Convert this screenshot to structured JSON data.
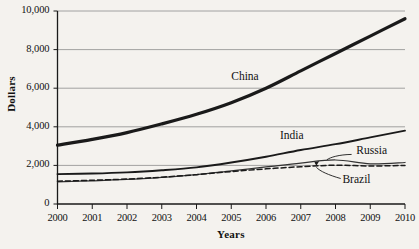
{
  "chart_data": {
    "type": "line",
    "title": "",
    "xlabel": "Years",
    "ylabel": "Dollars",
    "x": [
      2000,
      2001,
      2002,
      2003,
      2004,
      2005,
      2006,
      2007,
      2008,
      2009,
      2010
    ],
    "x_ticks": [
      "2000",
      "2001",
      "2002",
      "2003",
      "2004",
      "2005",
      "2006",
      "2007",
      "2008",
      "2009",
      "2010"
    ],
    "y_ticks": [
      "0",
      "2,000",
      "4,000",
      "6,000",
      "8,000",
      "10,000"
    ],
    "y_tick_values": [
      0,
      2000,
      4000,
      6000,
      8000,
      10000
    ],
    "ylim": [
      0,
      10000
    ],
    "xlim": [
      2000,
      2010
    ],
    "grid": "horizontal",
    "legend_position": "inline-labels",
    "series": [
      {
        "name": "China",
        "style": "solid-thick",
        "color": "#1a1a1a",
        "values": [
          3050,
          3350,
          3700,
          4150,
          4650,
          5250,
          6000,
          6900,
          7800,
          8700,
          9600
        ],
        "label_x": 2005.0,
        "label_y": 6550
      },
      {
        "name": "India",
        "style": "solid-medium",
        "color": "#1a1a1a",
        "values": [
          1550,
          1580,
          1640,
          1750,
          1900,
          2150,
          2450,
          2800,
          3100,
          3450,
          3800
        ],
        "label_x": 2006.4,
        "label_y": 3450
      },
      {
        "name": "Russia",
        "style": "solid-thin",
        "color": "#333333",
        "values": [
          1150,
          1200,
          1270,
          1380,
          1520,
          1720,
          1920,
          2120,
          2280,
          2080,
          2150
        ],
        "label_x": 2008.6,
        "label_y": 2700,
        "leader": true
      },
      {
        "name": "Brazil",
        "style": "dashed",
        "color": "#1a1a1a",
        "values": [
          1180,
          1230,
          1290,
          1390,
          1520,
          1680,
          1820,
          1930,
          2010,
          1970,
          2000
        ],
        "label_x": 2008.2,
        "label_y": 1180,
        "leader": true
      }
    ],
    "annotations": [
      {
        "text": "Russia",
        "target_x": 2008.0,
        "target_y": 2280
      },
      {
        "text": "Brazil",
        "target_x": 2007.6,
        "target_y": 1960
      }
    ]
  }
}
